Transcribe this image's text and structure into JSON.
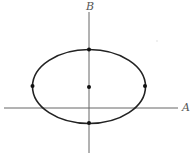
{
  "diagram": {
    "type": "ellipse-on-axes",
    "axes": {
      "horizontal_label": "A",
      "vertical_label": "B",
      "origin": [
        89,
        108
      ],
      "horizontal_extent": [
        4,
        178
      ],
      "vertical_extent": [
        8,
        153
      ]
    },
    "ellipse": {
      "cx": 89,
      "cy": 87,
      "rx": 56.5,
      "ry": 37,
      "stroke": "#222222"
    },
    "points": [
      {
        "name": "top",
        "x": 89,
        "y": 50
      },
      {
        "name": "center",
        "x": 89,
        "y": 87
      },
      {
        "name": "left",
        "x": 32,
        "y": 86
      },
      {
        "name": "right",
        "x": 145,
        "y": 86
      },
      {
        "name": "bottom",
        "x": 89,
        "y": 123
      }
    ],
    "colors": {
      "axis": "#666666",
      "curve": "#222222",
      "point": "#111111"
    }
  }
}
